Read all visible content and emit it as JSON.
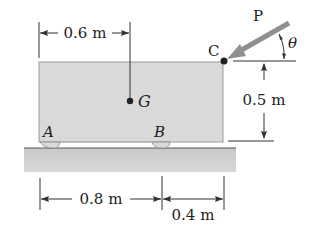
{
  "diagram": {
    "labels": {
      "A": "A",
      "B": "B",
      "C": "C",
      "G": "G",
      "P": "P",
      "theta": "θ"
    },
    "dimensions": {
      "top": "0.6 m",
      "right": "0.5 m",
      "bottom_left": "0.8 m",
      "bottom_right": "0.4 m"
    },
    "colors": {
      "block_fill": "#d9d9d9",
      "ground_fill": "#c8c8c8",
      "arrow": "#8f8f8f",
      "line": "#333333"
    }
  }
}
